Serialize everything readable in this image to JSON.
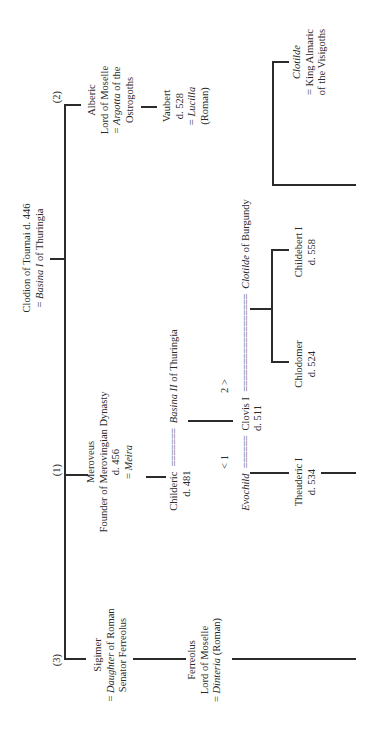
{
  "diagram": {
    "orientation": "rotated -90deg",
    "line_color": "#2b2b2b",
    "root": {
      "name": "Clodion of Tournai d. 446",
      "spouse_prefix": "= ",
      "spouse": "Basina I",
      "spouse_suffix": " of Thuringia"
    },
    "branches": {
      "b2": {
        "marker": "(2)",
        "name": "Alberic",
        "title": "Lord of Moselle",
        "spouse_prefix": "= ",
        "spouse": "Argotta",
        "spouse_suffix": " of the",
        "spouse_line2": "Ostrogoths",
        "child": {
          "name": "Vaubert",
          "died": "d. 528",
          "spouse_prefix": "= ",
          "spouse": "Lucilla",
          "spouse_note": "(Roman)"
        }
      },
      "b1": {
        "marker": "(1)",
        "name": "Meroveus",
        "title": "Founder of Merovingian Dynasty",
        "died": "d. 456",
        "spouse_prefix": "= ",
        "spouse": "Meira",
        "child": {
          "name": "Childeric",
          "died": "d. 481",
          "marriage_symbol": "=======",
          "spouse": "Basina II",
          "spouse_suffix": " of Thuringia",
          "child": {
            "name": "Clovis I",
            "died": "d. 511",
            "marriage1_marker": "< 1",
            "marriage1_symbol": "======",
            "wife1": "Evochild",
            "marriage2_marker": "2 >",
            "marriage2_symbol": "==================",
            "wife2": "Clotilde",
            "wife2_suffix": " of Burgundy",
            "children_wife1": [
              {
                "name": "Theuderic I",
                "died": "d. 534"
              }
            ],
            "children_wife2": [
              {
                "name": "Chlodomer",
                "died": "d. 524"
              },
              {
                "name": "Childebert I",
                "died": "d. 558"
              },
              {
                "name": "Clotilde",
                "spouse_prefix": "= ",
                "spouse": "King Almaric",
                "spouse_line2": "of the Visigoths"
              }
            ]
          }
        }
      },
      "b3": {
        "marker": "(3)",
        "name": "Sigimer",
        "spouse_prefix": "= ",
        "spouse": "Daughter",
        "spouse_suffix": " of Roman",
        "spouse_line2": "Senator Ferreolus",
        "child": {
          "name": "Ferreolus",
          "title": "Lord of Moselle",
          "spouse_prefix": "= ",
          "spouse": "Dinteria",
          "spouse_suffix": " (Roman)"
        }
      }
    }
  }
}
